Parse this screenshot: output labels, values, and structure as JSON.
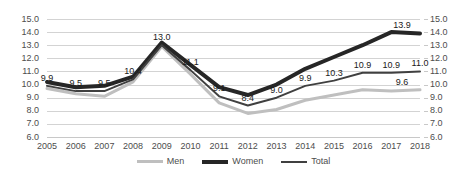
{
  "chart_data": {
    "type": "line",
    "title": "",
    "subtitle": "",
    "xlabel": "",
    "ylabel": "",
    "grid": true,
    "legend_position": "bottom",
    "ylim": [
      6.0,
      15.0
    ],
    "ytick_step": 1.0,
    "yticks": [
      "15.0",
      "14.0",
      "13.0",
      "12.0",
      "11.0",
      "10.0",
      "9.0",
      "8.0",
      "7.0",
      "6.0"
    ],
    "ytick_values": [
      15.0,
      14.0,
      13.0,
      12.0,
      11.0,
      10.0,
      9.0,
      8.0,
      7.0,
      6.0
    ],
    "dual_y_axis": true,
    "categories": [
      "2005",
      "2006",
      "2007",
      "2008",
      "2009",
      "2010",
      "2011",
      "2012",
      "2013",
      "2014",
      "2015",
      "2016",
      "2017",
      "2018"
    ],
    "x": [
      2005,
      2006,
      2007,
      2008,
      2009,
      2010,
      2011,
      2012,
      2013,
      2014,
      2015,
      2016,
      2017,
      2018
    ],
    "series": [
      {
        "name": "Men",
        "color": "#bfbfbf",
        "width": 3,
        "values": [
          9.7,
          9.3,
          9.1,
          10.2,
          12.9,
          10.8,
          8.6,
          7.8,
          8.1,
          8.8,
          9.2,
          9.6,
          9.5,
          9.6
        ]
      },
      {
        "name": "Women",
        "color": "#262626",
        "width": 4,
        "values": [
          10.2,
          9.8,
          9.9,
          10.6,
          13.2,
          11.5,
          9.8,
          9.2,
          10.0,
          11.2,
          12.1,
          13.0,
          14.0,
          13.9
        ]
      },
      {
        "name": "Total",
        "color": "#404040",
        "width": 2,
        "values": [
          9.9,
          9.5,
          9.5,
          10.4,
          13.0,
          11.1,
          9.1,
          8.4,
          9.0,
          9.9,
          10.3,
          10.9,
          10.9,
          11.0
        ]
      }
    ],
    "data_labels": {
      "series": "Total",
      "values": [
        "9.9",
        "9.5",
        "9.5",
        "10.4",
        "13.0",
        "11.1",
        "9.1",
        "8.4",
        "9.0",
        "9.9",
        "10.3",
        "10.9",
        "10.9",
        "11.0"
      ]
    },
    "endpoint_labels": [
      {
        "series": "Women",
        "category": "2018",
        "value": "13.9"
      },
      {
        "series": "Men",
        "category": "2018",
        "value": "9.6"
      }
    ]
  },
  "legend": {
    "items": [
      {
        "label": "Men",
        "key": "men"
      },
      {
        "label": "Women",
        "key": "women"
      },
      {
        "label": "Total",
        "key": "total"
      }
    ]
  }
}
